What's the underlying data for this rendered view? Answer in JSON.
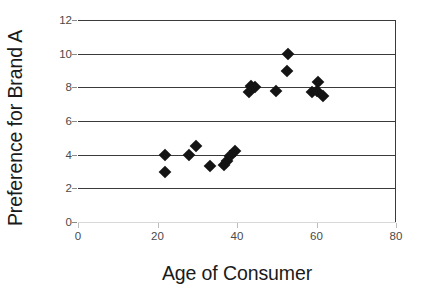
{
  "chart_data": {
    "type": "scatter",
    "title": "",
    "xlabel": "Age of Consumer",
    "ylabel": "Preference for Brand A",
    "xlim": [
      0,
      80
    ],
    "ylim": [
      0,
      12
    ],
    "xticks": [
      0,
      20,
      40,
      60,
      80
    ],
    "yticks": [
      0,
      2,
      4,
      6,
      8,
      10,
      12
    ],
    "grid": true,
    "grid_orientation": "horizontal",
    "legend": null,
    "marker": "diamond",
    "marker_color": "#141414",
    "points": [
      {
        "x": 21.8,
        "y": 4.0
      },
      {
        "x": 21.8,
        "y": 3.0
      },
      {
        "x": 27.8,
        "y": 4.0
      },
      {
        "x": 29.6,
        "y": 4.5
      },
      {
        "x": 33.2,
        "y": 3.3
      },
      {
        "x": 36.8,
        "y": 3.4
      },
      {
        "x": 37.6,
        "y": 3.6
      },
      {
        "x": 38.2,
        "y": 3.9
      },
      {
        "x": 39.4,
        "y": 4.2
      },
      {
        "x": 42.9,
        "y": 7.7
      },
      {
        "x": 43.6,
        "y": 8.1
      },
      {
        "x": 44.6,
        "y": 8.0
      },
      {
        "x": 49.8,
        "y": 7.8
      },
      {
        "x": 52.6,
        "y": 9.0
      },
      {
        "x": 52.9,
        "y": 10.0
      },
      {
        "x": 58.9,
        "y": 7.7
      },
      {
        "x": 60.4,
        "y": 8.3
      },
      {
        "x": 60.2,
        "y": 7.8
      },
      {
        "x": 61.6,
        "y": 7.5
      }
    ]
  },
  "axis": {
    "y_title": "Preference for Brand A",
    "x_title": "Age of Consumer",
    "y_tick_labels": [
      "12",
      "10",
      "8",
      "6",
      "4",
      "2",
      "0"
    ],
    "x_tick_labels": [
      "0",
      "20",
      "40",
      "60",
      "80"
    ]
  },
  "colors": {
    "marker": "#141414",
    "gridline": "#3a3a3a",
    "axis_line": "#d8d8d8",
    "tick_text": "#4a4a4a",
    "title_text": "#1a1a1a",
    "background": "#ffffff"
  }
}
